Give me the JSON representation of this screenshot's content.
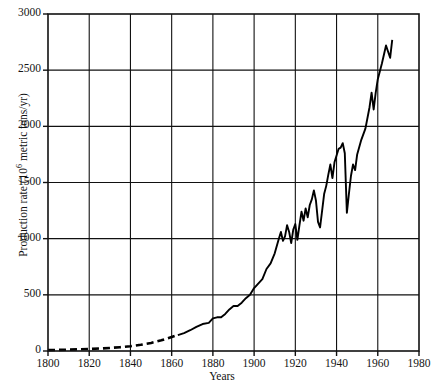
{
  "chart_data": {
    "type": "line",
    "title": "",
    "xlabel": "Years",
    "ylabel_text": "Production rate (10",
    "ylabel_exp": "6",
    "ylabel_tail": " metric tons/yr)",
    "ylabel_full": "Production rate (10⁶ metric tons/yr)",
    "xlim": [
      1800,
      1980
    ],
    "ylim": [
      0,
      3000
    ],
    "xticks": [
      1800,
      1820,
      1840,
      1860,
      1880,
      1900,
      1920,
      1940,
      1960,
      1980
    ],
    "yticks": [
      0,
      500,
      1000,
      1500,
      2000,
      2500,
      3000
    ],
    "grid": true,
    "legend": "none",
    "line_color": "#000000",
    "series": [
      {
        "name": "estimated",
        "style": "dashed",
        "x": [
          1800,
          1805,
          1810,
          1815,
          1820,
          1825,
          1830,
          1835,
          1840,
          1845,
          1850,
          1855,
          1860,
          1863
        ],
        "values": [
          8,
          10,
          12,
          15,
          18,
          22,
          27,
          34,
          42,
          55,
          72,
          95,
          125,
          142
        ]
      },
      {
        "name": "measured",
        "style": "solid",
        "x": [
          1863,
          1866,
          1869,
          1872,
          1875,
          1878,
          1880,
          1882,
          1884,
          1886,
          1888,
          1890,
          1892,
          1894,
          1896,
          1898,
          1900,
          1902,
          1904,
          1906,
          1908,
          1910,
          1912,
          1913,
          1914,
          1915,
          1916,
          1917,
          1918,
          1919,
          1920,
          1921,
          1922,
          1923,
          1924,
          1925,
          1926,
          1927,
          1928,
          1929,
          1930,
          1931,
          1932,
          1933,
          1934,
          1935,
          1936,
          1937,
          1938,
          1939,
          1940,
          1941,
          1942,
          1943,
          1944,
          1945,
          1946,
          1947,
          1948,
          1949,
          1950,
          1952,
          1954,
          1956,
          1957,
          1958,
          1959,
          1960,
          1962,
          1964,
          1966,
          1967
        ],
        "values": [
          142,
          160,
          185,
          215,
          240,
          250,
          290,
          300,
          300,
          330,
          370,
          400,
          400,
          430,
          470,
          500,
          560,
          600,
          640,
          730,
          780,
          870,
          1000,
          1060,
          980,
          1020,
          1120,
          1060,
          960,
          1080,
          1130,
          990,
          1120,
          1240,
          1160,
          1270,
          1190,
          1300,
          1350,
          1430,
          1340,
          1150,
          1100,
          1250,
          1400,
          1470,
          1570,
          1660,
          1540,
          1680,
          1740,
          1800,
          1810,
          1850,
          1760,
          1230,
          1400,
          1560,
          1660,
          1610,
          1750,
          1880,
          1980,
          2170,
          2300,
          2150,
          2300,
          2420,
          2560,
          2720,
          2610,
          2770
        ]
      }
    ]
  }
}
